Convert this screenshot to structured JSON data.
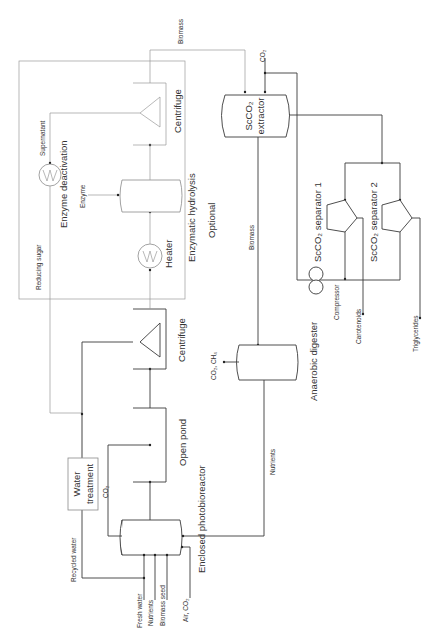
{
  "diagram": {
    "orientation": "rotated 90 degrees counter-clockwise",
    "units": {
      "enclosed_photobioreactor": "Enclosed photobioreactor",
      "open_pond": "Open pond",
      "centrifuge_1": "Centrifuge",
      "water_treatment_line1": "Water",
      "water_treatment_line2": "treatment",
      "heater": "Heater",
      "enzymatic_hydrolysis": "Enzymatic hydrolysis",
      "enzyme_deactivation": "Enzyme deactivation",
      "centrifuge_2": "Centrifuge",
      "optional_region": "Optional",
      "scco2_extractor_line1": "ScCO₂",
      "scco2_extractor_line2": "extractor",
      "scco2_separator_1": "ScCO₂ separator 1",
      "scco2_separator_2": "ScCO₂ separator 2",
      "compressor": "Compressor",
      "anaerobic_digester": "Anaerobic digester"
    },
    "streams": {
      "fresh_water": "Fresh water",
      "nutrients_in": "Nutrients",
      "biomass_seed": "Biomass seed",
      "air_co2": "Air, CO₂",
      "recycled_water": "Recycled water",
      "co2_pond": "CO₂",
      "reducing_sugar": "Reducing sugar",
      "supernatant": "Supernatant",
      "enzyme": "Enzyme",
      "biomass_top": "Biomass",
      "co2_extractor": "CO₂",
      "biomass_to_digester": "Biomass",
      "co2_ch4": "CO₂, CH₄",
      "nutrients_recycle": "Nutrients",
      "carotenoids": "Carotenoids",
      "triglycerides": "Triglycerides"
    }
  }
}
